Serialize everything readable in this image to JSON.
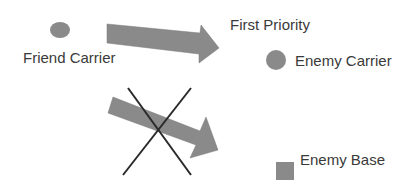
{
  "diagram": {
    "nodes": {
      "friend_carrier": {
        "label": "Friend Carrier",
        "shape": "circle",
        "color": "#8a8a8a"
      },
      "enemy_carrier": {
        "label": "Enemy Carrier",
        "shape": "circle",
        "color": "#8a8a8a"
      },
      "enemy_base": {
        "label": "Enemy Base",
        "shape": "square",
        "color": "#8a8a8a"
      }
    },
    "edges": [
      {
        "from": "friend_carrier",
        "to": "enemy_carrier",
        "label": "First Priority",
        "crossed_out": false,
        "color": "#8a8a8a"
      },
      {
        "from": "friend_carrier",
        "to": "enemy_base",
        "label": "",
        "crossed_out": true,
        "color": "#8a8a8a"
      }
    ],
    "cross_color": "#2a2a2a"
  }
}
